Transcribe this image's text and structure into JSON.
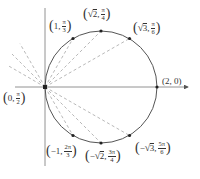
{
  "diagram": {
    "colors": {
      "curve": "#555555",
      "axis": "#777777",
      "dashed": "#999999",
      "point": "#222222",
      "text": "#333333"
    },
    "scale_px_per_unit": 56,
    "pole_px": [
      45,
      87
    ],
    "points": [
      {
        "id": "p-pole",
        "r": "0",
        "theta_num": "π",
        "theta_den": "2",
        "sqrt": false,
        "neg": false
      },
      {
        "id": "p-1-pi3",
        "r": "1",
        "theta_num": "π",
        "theta_den": "3",
        "sqrt": false,
        "neg": false
      },
      {
        "id": "p-sqrt2-pi4",
        "r": "2",
        "theta_num": "π",
        "theta_den": "4",
        "sqrt": true,
        "neg": false
      },
      {
        "id": "p-sqrt3-pi6",
        "r": "3",
        "theta_num": "π",
        "theta_den": "6",
        "sqrt": true,
        "neg": false
      },
      {
        "id": "p-2-0",
        "r": "2",
        "theta": "0"
      },
      {
        "id": "p-neg1-2pi3",
        "r": "1",
        "theta_num": "2π",
        "theta_den": "3",
        "sqrt": false,
        "neg": true
      },
      {
        "id": "p-negsqrt2-3pi4",
        "r": "2",
        "theta_num": "3π",
        "theta_den": "4",
        "sqrt": true,
        "neg": true
      },
      {
        "id": "p-negsqrt3-5pi6",
        "r": "3",
        "theta_num": "5π",
        "theta_den": "6",
        "sqrt": true,
        "neg": true
      }
    ],
    "labels": {
      "pole": {
        "r": "0",
        "num": "π",
        "den": "2"
      },
      "one_pi3": {
        "r": "1",
        "num": "π",
        "den": "3"
      },
      "sqrt2_pi4": {
        "rad": "√",
        "radicand": "2",
        "num": "π",
        "den": "4"
      },
      "sqrt3_pi6": {
        "rad": "√",
        "radicand": "3",
        "num": "π",
        "den": "6"
      },
      "two_zero": {
        "text": "(2, 0)"
      },
      "neg1_2pi3": {
        "r": "−1",
        "num": "2π",
        "den": "3"
      },
      "negsqrt2_3pi4": {
        "sign": "−",
        "rad": "√",
        "radicand": "2",
        "num": "3π",
        "den": "4"
      },
      "negsqrt3_5pi6": {
        "sign": "−",
        "rad": "√",
        "radicand": "3",
        "num": "5π",
        "den": "6"
      }
    },
    "punct": {
      "open": "(",
      "close": ")",
      "comma": ","
    }
  }
}
